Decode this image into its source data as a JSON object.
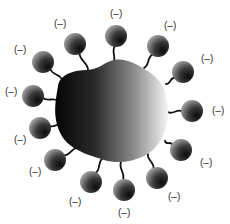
{
  "diagram": {
    "type": "charged-particle-with-surface-groups",
    "core": {
      "shape": "irregular-blob",
      "gradient": {
        "from": "#0a0a0a",
        "to": "#f4f4f4",
        "direction": "left-to-right"
      }
    },
    "sphere_color": {
      "dark": "#111111",
      "light": "#9a9a9a"
    },
    "tether_color": "#111111",
    "groups": [
      {
        "cx": 43,
        "cy": 62,
        "ax": 62,
        "ay": 80,
        "lx": 14,
        "ly": 53,
        "label": "(–)"
      },
      {
        "cx": 75,
        "cy": 44,
        "ax": 88,
        "ay": 70,
        "lx": 54,
        "ly": 27,
        "label": "(–)"
      },
      {
        "cx": 116,
        "cy": 36,
        "ax": 113,
        "ay": 63,
        "lx": 110,
        "ly": 17,
        "label": "(–)"
      },
      {
        "cx": 158,
        "cy": 46,
        "ax": 144,
        "ay": 68,
        "lx": 164,
        "ly": 29,
        "label": "(–)"
      },
      {
        "cx": 183,
        "cy": 72,
        "ax": 166,
        "ay": 84,
        "lx": 201,
        "ly": 62,
        "label": "(–)"
      },
      {
        "cx": 192,
        "cy": 111,
        "ax": 168,
        "ay": 112,
        "lx": 212,
        "ly": 114,
        "label": "(–)"
      },
      {
        "cx": 181,
        "cy": 150,
        "ax": 165,
        "ay": 141,
        "lx": 200,
        "ly": 166,
        "label": "(–)"
      },
      {
        "cx": 157,
        "cy": 178,
        "ax": 148,
        "ay": 154,
        "lx": 168,
        "ly": 200,
        "label": "(–)"
      },
      {
        "cx": 124,
        "cy": 190,
        "ax": 121,
        "ay": 162,
        "lx": 118,
        "ly": 216,
        "label": "(–)"
      },
      {
        "cx": 91,
        "cy": 182,
        "ax": 103,
        "ay": 158,
        "lx": 69,
        "ly": 205,
        "label": "(–)"
      },
      {
        "cx": 55,
        "cy": 160,
        "ax": 78,
        "ay": 148,
        "lx": 29,
        "ly": 175,
        "label": "(–)"
      },
      {
        "cx": 40,
        "cy": 128,
        "ax": 66,
        "ay": 123,
        "lx": 14,
        "ly": 143,
        "label": "(–)"
      },
      {
        "cx": 33,
        "cy": 96,
        "ax": 58,
        "ay": 101,
        "lx": 5,
        "ly": 95,
        "label": "(–)"
      }
    ]
  }
}
